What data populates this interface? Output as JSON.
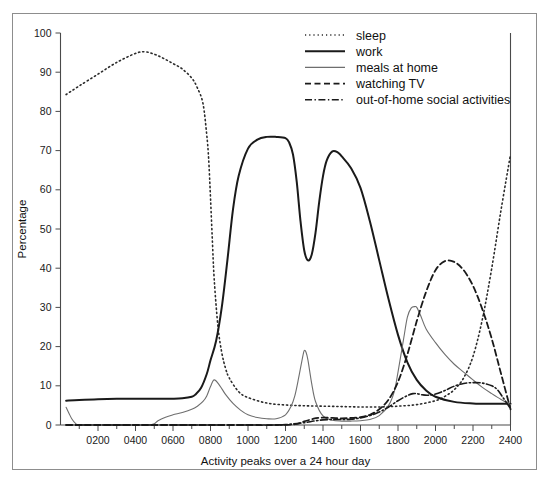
{
  "figure": {
    "frame_color": "#8d8d8d",
    "background": "#ffffff"
  },
  "chart_data": {
    "type": "line",
    "title": "",
    "subtitle": "",
    "xlabel": "Activity peaks over a 24 hour day",
    "ylabel": "Percentage",
    "xlim": [
      0,
      2400
    ],
    "ylim": [
      0,
      100
    ],
    "grid": false,
    "legend_position": "top-right",
    "x_ticks": [
      200,
      400,
      600,
      800,
      1000,
      1200,
      1400,
      1600,
      1800,
      2000,
      2200,
      2400
    ],
    "x_tick_labels": [
      "0200",
      "0400",
      "0600",
      "0800",
      "1000",
      "1200",
      "1400",
      "1600",
      "1800",
      "2000",
      "2200",
      "2400"
    ],
    "x_minor_ticks": [
      100,
      300,
      500,
      700,
      900,
      1100,
      1300,
      1500,
      1700,
      1900,
      2100,
      2300
    ],
    "y_ticks": [
      0,
      10,
      20,
      30,
      40,
      50,
      60,
      70,
      80,
      90,
      100
    ],
    "y_tick_labels": [
      "0",
      "10",
      "20",
      "30",
      "40",
      "50",
      "60",
      "70",
      "80",
      "90",
      "100"
    ],
    "series": [
      {
        "name": "sleep",
        "style": "dotted",
        "color": "#2b2b2b",
        "width": 1.6,
        "dasharray": "1.2 3.0",
        "x": [
          30,
          100,
          200,
          300,
          400,
          450,
          500,
          550,
          600,
          650,
          700,
          730,
          760,
          780,
          790,
          800,
          810,
          820,
          840,
          860,
          880,
          900,
          950,
          1000,
          1100,
          1200,
          1300,
          1400,
          1500,
          1600,
          1700,
          1800,
          1900,
          2000,
          2050,
          2100,
          2150,
          2200,
          2250,
          2300,
          2350,
          2400
        ],
        "y": [
          84.3,
          86.5,
          89.5,
          92.5,
          94.8,
          95.2,
          94.6,
          93.5,
          92.2,
          90.8,
          88.5,
          86.0,
          82.0,
          74.0,
          68.0,
          58.0,
          47.0,
          37.0,
          25.0,
          18.5,
          14.5,
          12.0,
          8.5,
          7.0,
          5.6,
          5.1,
          4.9,
          4.8,
          4.7,
          4.6,
          4.6,
          4.8,
          5.2,
          6.2,
          7.3,
          9.0,
          12.0,
          17.5,
          27.0,
          40.0,
          55.0,
          69.0
        ]
      },
      {
        "name": "work",
        "style": "solid",
        "color": "#1a1a1a",
        "width": 2.0,
        "dasharray": "",
        "x": [
          30,
          100,
          200,
          300,
          400,
          500,
          600,
          650,
          700,
          720,
          750,
          780,
          800,
          830,
          860,
          890,
          920,
          950,
          1000,
          1050,
          1100,
          1150,
          1200,
          1220,
          1240,
          1260,
          1280,
          1300,
          1320,
          1340,
          1360,
          1380,
          1400,
          1420,
          1450,
          1480,
          1500,
          1550,
          1600,
          1650,
          1700,
          1750,
          1800,
          1850,
          1900,
          1950,
          2000,
          2100,
          2200,
          2300,
          2400
        ],
        "y": [
          6.2,
          6.4,
          6.6,
          6.7,
          6.7,
          6.7,
          6.7,
          6.8,
          7.2,
          7.8,
          9.5,
          13.0,
          16.5,
          21.5,
          30.0,
          42.0,
          55.0,
          63.5,
          70.5,
          72.8,
          73.5,
          73.5,
          73.2,
          72.0,
          69.0,
          62.0,
          52.0,
          44.5,
          42.0,
          43.5,
          49.0,
          57.0,
          63.5,
          67.5,
          69.8,
          69.5,
          68.5,
          65.5,
          60.5,
          52.0,
          42.0,
          32.0,
          23.0,
          16.0,
          11.5,
          8.8,
          7.2,
          5.9,
          5.5,
          5.4,
          5.4
        ]
      },
      {
        "name": "meals at home",
        "style": "thin-solid",
        "color": "#6e6e6e",
        "width": 1.1,
        "dasharray": "",
        "x": [
          30,
          45,
          60,
          80,
          100,
          200,
          300,
          400,
          470,
          500,
          520,
          560,
          600,
          650,
          700,
          730,
          760,
          780,
          800,
          820,
          850,
          880,
          920,
          960,
          1000,
          1050,
          1100,
          1150,
          1200,
          1230,
          1250,
          1270,
          1290,
          1300,
          1310,
          1320,
          1340,
          1360,
          1400,
          1450,
          1500,
          1550,
          1600,
          1650,
          1700,
          1750,
          1780,
          1800,
          1830,
          1850,
          1870,
          1890,
          1900,
          1920,
          1950,
          2000,
          2050,
          2100,
          2150,
          2200,
          2250,
          2300,
          2350,
          2400
        ],
        "y": [
          4.5,
          3.0,
          1.6,
          0.4,
          0.0,
          0.0,
          0.0,
          0.0,
          0.0,
          0.3,
          1.1,
          2.0,
          2.6,
          3.2,
          4.0,
          4.8,
          6.0,
          7.4,
          9.8,
          11.5,
          10.0,
          7.8,
          5.5,
          3.8,
          2.6,
          1.9,
          1.6,
          1.6,
          2.6,
          4.8,
          7.5,
          12.0,
          17.0,
          19.0,
          18.5,
          16.5,
          10.5,
          6.0,
          2.3,
          1.2,
          1.0,
          1.0,
          1.1,
          1.4,
          2.4,
          5.0,
          8.5,
          13.5,
          22.0,
          27.5,
          29.8,
          30.2,
          30.0,
          28.0,
          24.5,
          21.0,
          18.0,
          15.5,
          13.5,
          11.5,
          9.6,
          8.0,
          6.5,
          5.2
        ]
      },
      {
        "name": "watching TV",
        "style": "dashed",
        "color": "#1a1a1a",
        "width": 1.8,
        "dasharray": "6 3.5",
        "x": [
          30,
          400,
          800,
          1000,
          1150,
          1250,
          1300,
          1350,
          1400,
          1450,
          1500,
          1550,
          1600,
          1650,
          1700,
          1750,
          1800,
          1850,
          1900,
          1950,
          2000,
          2050,
          2100,
          2150,
          2200,
          2250,
          2300,
          2350,
          2400
        ],
        "y": [
          0.0,
          0.0,
          0.0,
          0.0,
          0.0,
          0.2,
          0.9,
          1.6,
          1.9,
          1.8,
          1.7,
          1.8,
          2.0,
          2.6,
          4.0,
          6.5,
          11.0,
          18.0,
          26.5,
          34.0,
          39.5,
          41.8,
          41.6,
          39.5,
          35.5,
          29.5,
          22.0,
          13.0,
          4.0
        ]
      },
      {
        "name": "out-of-home social activities",
        "style": "dash-dot",
        "color": "#1a1a1a",
        "width": 1.6,
        "dasharray": "7 2.5 1.4 2.5",
        "x": [
          30,
          400,
          800,
          1100,
          1200,
          1300,
          1350,
          1400,
          1450,
          1500,
          1550,
          1600,
          1650,
          1700,
          1750,
          1800,
          1850,
          1880,
          1900,
          1930,
          1960,
          2000,
          2050,
          2100,
          2150,
          2200,
          2250,
          2300,
          2330,
          2360,
          2400
        ],
        "y": [
          0.0,
          0.0,
          0.0,
          0.0,
          0.1,
          0.6,
          1.0,
          1.3,
          1.4,
          1.4,
          1.5,
          1.8,
          2.4,
          3.3,
          4.6,
          6.2,
          7.5,
          8.0,
          8.0,
          7.7,
          7.6,
          7.9,
          8.8,
          9.9,
          10.6,
          10.8,
          10.7,
          10.0,
          9.0,
          7.0,
          4.2
        ]
      }
    ]
  },
  "legend": {
    "entries": [
      {
        "label": "sleep"
      },
      {
        "label": "work"
      },
      {
        "label": "meals at home"
      },
      {
        "label": "watching TV"
      },
      {
        "label": "out-of-home social activities"
      }
    ]
  }
}
